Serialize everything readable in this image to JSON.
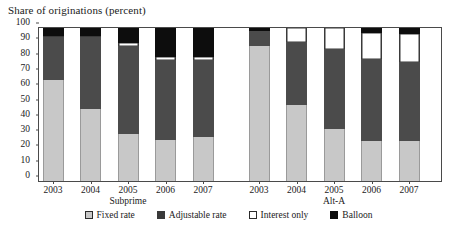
{
  "chart_data": {
    "type": "bar",
    "title": "Share of originations (percent)",
    "subtitle": "",
    "xlabel": "",
    "ylabel": "",
    "ylim": [
      0,
      100
    ],
    "ytick_values": [
      0,
      10,
      20,
      30,
      40,
      50,
      60,
      70,
      80,
      90,
      100
    ],
    "ytick_labels": [
      "0",
      "10",
      "20",
      "30",
      "40",
      "50",
      "60",
      "70",
      "80",
      "90",
      "100"
    ],
    "grid": false,
    "stacked": true,
    "legend_position": "bottom",
    "categories": [
      "2003",
      "2004",
      "2005",
      "2006",
      "2007",
      "2003",
      "2004",
      "2005",
      "2006",
      "2007"
    ],
    "groups": [
      {
        "name": "Subprime",
        "categories": [
          "2003",
          "2004",
          "2005",
          "2006",
          "2007"
        ]
      },
      {
        "name": "Alt-A",
        "categories": [
          "2003",
          "2004",
          "2005",
          "2006",
          "2007"
        ]
      }
    ],
    "series": [
      {
        "name": "Fixed rate",
        "color": "#c8c8c8",
        "values": [
          66,
          47,
          31,
          27,
          29,
          88,
          50,
          34,
          26,
          26
        ]
      },
      {
        "name": "Adjustable rate",
        "color": "#4b4b4b",
        "values": [
          28,
          47,
          57,
          52,
          50,
          10,
          41,
          52,
          54,
          52
        ]
      },
      {
        "name": "Interest only",
        "color": "#ffffff",
        "values": [
          1,
          1,
          2,
          2,
          2,
          0,
          9,
          14,
          17,
          18
        ]
      },
      {
        "name": "Balloon",
        "color": "#0d0d0d",
        "values": [
          5,
          5,
          10,
          19,
          19,
          2,
          0,
          0,
          3,
          4
        ]
      }
    ]
  },
  "legend": {
    "items": [
      {
        "label": "Fixed rate",
        "swatch": "fixed-rate-swatch"
      },
      {
        "label": "Adjustable rate",
        "swatch": "adjustable-rate-swatch"
      },
      {
        "label": "Interest only",
        "swatch": "interest-only-swatch"
      },
      {
        "label": "Balloon",
        "swatch": "balloon-swatch"
      }
    ]
  }
}
